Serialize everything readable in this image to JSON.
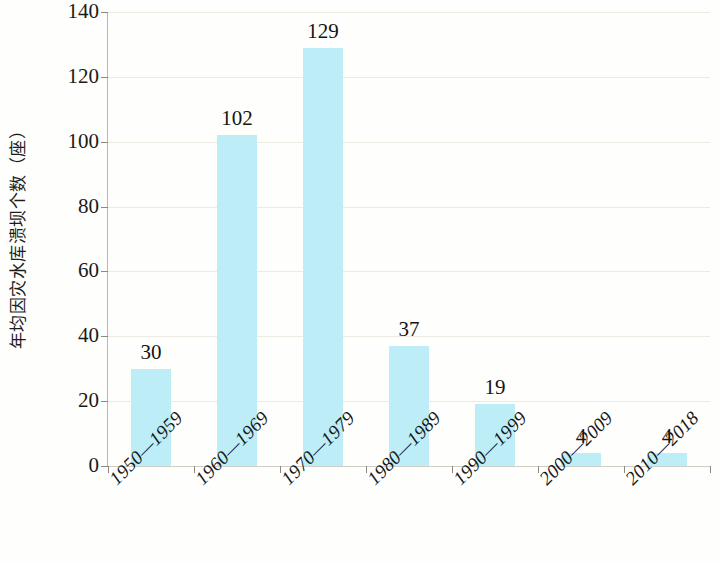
{
  "chart_data": {
    "type": "bar",
    "title": "",
    "subtitle": "",
    "xlabel": "",
    "ylabel": "年均因灾水库溃坝个数（座）",
    "categories": [
      "1950—1959",
      "1960—1969",
      "1970—1979",
      "1980—1989",
      "1990—1999",
      "2000—2009",
      "2010—2018"
    ],
    "values": [
      30,
      102,
      129,
      37,
      19,
      4,
      4
    ],
    "value_labels": [
      "30",
      "102",
      "129",
      "37",
      "19",
      "4",
      "4"
    ],
    "ylim": [
      0,
      140
    ],
    "ytick_labels": [
      "0",
      "20",
      "40",
      "60",
      "80",
      "100",
      "120",
      "140"
    ],
    "ytick_values": [
      0,
      20,
      40,
      60,
      80,
      100,
      120,
      140
    ],
    "grid": true,
    "legend": false,
    "legend_position": "none",
    "bar_color": "#bdeef7",
    "gridline_color": "#eceae1",
    "axis_color": "#b9b7ae",
    "text_color": "#1a1a18",
    "background_color": "#fefefd",
    "xlabel_rotation": -45
  }
}
